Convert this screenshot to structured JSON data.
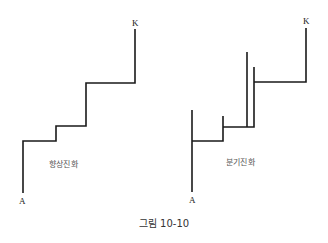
{
  "figure": {
    "caption": "그림 10-10",
    "left": {
      "title": "향상진화",
      "start_label": "A",
      "end_label": "K",
      "path_description": "single staircase lineage from A up to K (anagenesis)"
    },
    "right": {
      "title": "분기진화",
      "start_label": "A",
      "end_label": "K",
      "path_description": "staircase lineage from A to K with side branches at each step (cladogenesis)"
    },
    "line_color": "#1a1a1a"
  }
}
